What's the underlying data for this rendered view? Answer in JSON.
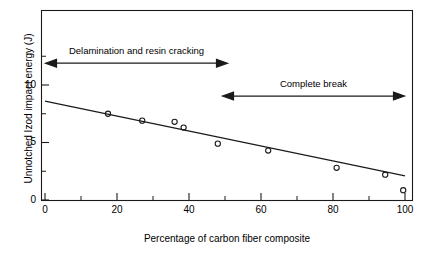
{
  "chart_data": {
    "type": "scatter",
    "title": "",
    "xlabel": "Percentage of carbon fiber composite",
    "ylabel": "Unnotched Izod impact energy (J)",
    "xlim": [
      0,
      100
    ],
    "ylim": [
      0,
      13.9
    ],
    "grid": false,
    "legend": null,
    "x_major_ticks": [
      0,
      20,
      40,
      60,
      80,
      100
    ],
    "x_minor_ticks": [
      10,
      30,
      50,
      70,
      90
    ],
    "y_major_ticks": [
      0,
      5,
      10
    ],
    "y_minor_ticks": [
      2.5,
      7.5,
      12.5
    ],
    "x_tick_labels": [
      "0",
      "20",
      "40",
      "60",
      "80",
      "100"
    ],
    "y_tick_labels": [
      "0",
      "5",
      "10"
    ],
    "series": [
      {
        "name": "Unnotched Izod impact energy",
        "marker": "open-circle",
        "points": [
          {
            "x": 17.5,
            "y": 7.5
          },
          {
            "x": 27.0,
            "y": 6.9
          },
          {
            "x": 36.0,
            "y": 6.8
          },
          {
            "x": 38.5,
            "y": 6.3
          },
          {
            "x": 48.0,
            "y": 4.9
          },
          {
            "x": 62.0,
            "y": 4.3
          },
          {
            "x": 81.0,
            "y": 2.8
          },
          {
            "x": 94.5,
            "y": 2.2
          },
          {
            "x": 99.5,
            "y": 0.85
          }
        ]
      },
      {
        "name": "linear fit",
        "marker": "line",
        "points": [
          {
            "x": 0,
            "y": 8.6
          },
          {
            "x": 100,
            "y": 2.1
          }
        ]
      }
    ],
    "annotations": [
      {
        "id": "delamination",
        "text": "Delamination and resin cracking",
        "arrow": "double",
        "x_start": 1,
        "x_end": 51,
        "y": 11.9
      },
      {
        "id": "complete-break",
        "text": "Complete break",
        "arrow": "double",
        "x_start": 49,
        "x_end": 100,
        "y": 9.05
      }
    ],
    "colors": {
      "axis": "#1a1a1a",
      "marker": "#1a1a1a",
      "line": "#1a1a1a",
      "background": "#ffffff"
    }
  }
}
